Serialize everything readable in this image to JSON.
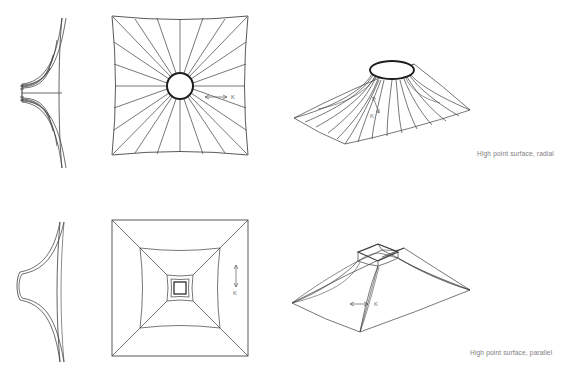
{
  "figure": {
    "title_visible": false,
    "background_color": "#ffffff",
    "line_color": "#3c3c3c",
    "caption_color": "#7d7d7d",
    "rows": [
      {
        "id": "radial",
        "caption": "High point surface, radial",
        "caption_position": {
          "x": 477,
          "y": 150
        },
        "views": [
          "elevation",
          "plan",
          "isometric"
        ],
        "apex_ring_shape": "circle",
        "cable_pattern": "radial",
        "k_label": "K",
        "k_arrow_plan": "horizontal-double-arrow",
        "k_arrow_iso": "vertical-double-arrow"
      },
      {
        "id": "parallel",
        "caption": "High point surface, parallel",
        "caption_position": {
          "x": 470,
          "y": 349
        },
        "views": [
          "elevation",
          "plan",
          "isometric"
        ],
        "apex_ring_shape": "square",
        "cable_pattern": "parallel",
        "k_label": "K",
        "k_arrow_plan": "vertical-double-arrow",
        "k_arrow_iso": "horizontal-double-arrow"
      }
    ],
    "labels": {
      "k_plan_radial": "K",
      "k_plan_parallel": "K",
      "k_iso_radial": "K",
      "k_iso_parallel": "K"
    },
    "geometry": {
      "elevation_radial": {
        "bbox": {
          "x": 14,
          "y": 18,
          "w": 64,
          "h": 148
        },
        "ring_x": 22,
        "ring_top": 84,
        "ring_bottom": 102,
        "edge_x": 62,
        "curve_count": 9,
        "description": "hyperbolic profile, cables fan from central mast ring out to low perimeter"
      },
      "plan_radial": {
        "bbox": {
          "x": 112,
          "y": 16,
          "w": 136,
          "h": 139
        },
        "center": {
          "x": 180,
          "y": 86
        },
        "ring_radius": 13,
        "ring_stroke": 2,
        "radial_line_count": 20,
        "edge_sag": 7,
        "description": "square plan with concave edges, 20 radial cables converging on circular high-point ring"
      },
      "iso_radial": {
        "bbox": {
          "x": 290,
          "y": 48,
          "w": 180,
          "h": 100
        },
        "apex": {
          "x": 392,
          "y": 70,
          "rx": 22,
          "ry": 9
        },
        "base_points": [
          [
            294,
            118
          ],
          [
            345,
            144
          ],
          [
            470,
            110
          ],
          [
            414,
            64
          ]
        ],
        "radial_line_count": 20,
        "description": "conical tensile membrane seen in perspective, radial cables to elliptical ring"
      },
      "elevation_parallel": {
        "bbox": {
          "x": 14,
          "y": 222,
          "w": 64,
          "h": 140
        },
        "ring_x": 20,
        "ring_top": 272,
        "ring_bottom": 300,
        "edge_x": 60,
        "curve_count": 4,
        "description": "smoother hyperbolic profile with small square ring notch at centre"
      },
      "plan_parallel": {
        "bbox": {
          "x": 112,
          "y": 220,
          "w": 136,
          "h": 136
        },
        "center": {
          "x": 180,
          "y": 288
        },
        "rings": [
          {
            "half": 68,
            "sag": 0
          },
          {
            "half": 40,
            "sag": 5
          },
          {
            "half": 17,
            "sag": 3
          },
          {
            "half": 13,
            "sag": 2
          },
          {
            "half": 9,
            "sag": 1
          }
        ],
        "diagonal_count": 4,
        "description": "square plan with nested concentric squares and corner diagonals"
      },
      "iso_parallel": {
        "bbox": {
          "x": 290,
          "y": 230,
          "w": 180,
          "h": 105
        },
        "apex_ring": [
          [
            358,
            252
          ],
          [
            378,
            244
          ],
          [
            398,
            252
          ],
          [
            378,
            261
          ]
        ],
        "base_points": [
          [
            292,
            303
          ],
          [
            360,
            332
          ],
          [
            470,
            290
          ],
          [
            404,
            248
          ]
        ],
        "description": "hip/pyramid tensile roof in perspective with small square high-point ring"
      }
    }
  }
}
